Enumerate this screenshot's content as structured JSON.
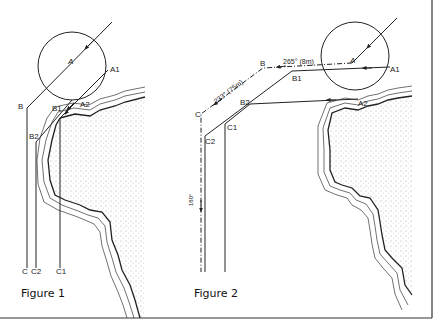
{
  "figures": [
    {
      "caption": "Figure 1",
      "labels": {
        "circle_center": "A",
        "a1": "A1",
        "a2": "A2",
        "b": "B",
        "b1": "B1",
        "b2": "B2",
        "c": "C",
        "c1": "C1",
        "c2": "C2"
      }
    },
    {
      "caption": "Figure 2",
      "labels": {
        "circle_center": "A",
        "a1": "A1",
        "a2": "A2",
        "b": "B",
        "b1": "B1",
        "b2": "B2",
        "c": "C",
        "c1": "C1",
        "c2": "C2",
        "leg1": "265° (8m)",
        "leg2": "233° (75m)",
        "leg3": "180°"
      }
    }
  ],
  "colors": {
    "line": "#222222",
    "stipple": "#555555",
    "border": "#333333"
  }
}
